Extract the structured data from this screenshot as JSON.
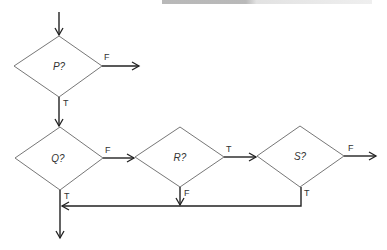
{
  "diagram": {
    "type": "flowchart",
    "decisions": [
      {
        "id": "P",
        "label": "P?"
      },
      {
        "id": "Q",
        "label": "Q?"
      },
      {
        "id": "R",
        "label": "R?"
      },
      {
        "id": "S",
        "label": "S?"
      }
    ],
    "edge_labels": {
      "p_false": "F",
      "p_true": "T",
      "q_false": "F",
      "q_true": "T",
      "r_true": "T",
      "r_false": "F",
      "s_false": "F",
      "s_true": "T"
    },
    "colors": {
      "stroke": "#333333",
      "diamond": "#777777"
    }
  }
}
